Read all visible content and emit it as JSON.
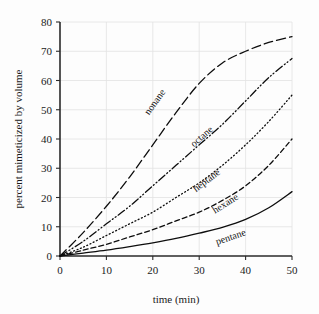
{
  "chart_data": {
    "type": "line",
    "title": "",
    "xlabel": "time (min)",
    "ylabel": "percent mimeticized by volume",
    "xlim": [
      0,
      50
    ],
    "ylim": [
      0,
      80
    ],
    "xticks": [
      0,
      10,
      20,
      30,
      40,
      50
    ],
    "yticks": [
      0,
      10,
      20,
      30,
      40,
      50,
      60,
      70,
      80
    ],
    "grid": true,
    "legend_position": "inline-curve-labels",
    "x": [
      0,
      5,
      10,
      15,
      20,
      25,
      30,
      35,
      40,
      45,
      50
    ],
    "series": [
      {
        "name": "nonane",
        "linestyle": "long-dash",
        "color": "#0d0d0d",
        "values": [
          0,
          8,
          17,
          27,
          38,
          49,
          59,
          66,
          70,
          73,
          75
        ],
        "label_x": 21,
        "label_y": 52
      },
      {
        "name": "octane",
        "linestyle": "dash-dot-dot",
        "color": "#0d0d0d",
        "values": [
          0,
          5,
          11,
          17,
          24,
          31,
          38,
          45,
          53,
          61,
          67.5
        ],
        "label_x": 31,
        "label_y": 40
      },
      {
        "name": "heptane",
        "linestyle": "dotted",
        "color": "#0d0d0d",
        "values": [
          0,
          3,
          7,
          11,
          15,
          20,
          25,
          31,
          38,
          46,
          55
        ],
        "label_x": 32,
        "label_y": 25
      },
      {
        "name": "hexane",
        "linestyle": "dashed",
        "color": "#0d0d0d",
        "values": [
          0,
          2,
          4,
          6.5,
          9,
          12,
          15,
          19,
          24,
          31,
          40
        ],
        "label_x": 36,
        "label_y": 17
      },
      {
        "name": "pentane",
        "linestyle": "solid",
        "color": "#0d0d0d",
        "values": [
          0,
          1,
          2,
          3.2,
          4.5,
          6,
          7.8,
          9.8,
          12.5,
          16.5,
          22
        ],
        "label_x": 37,
        "label_y": 5.5
      }
    ]
  },
  "axes": {
    "x_tick_labels": [
      "0",
      "10",
      "20",
      "30",
      "40",
      "50"
    ],
    "y_tick_labels": [
      "0",
      "10",
      "20",
      "30",
      "40",
      "50",
      "60",
      "70",
      "80"
    ],
    "x_axis_title": "time (min)",
    "y_axis_title": "percent mimeticized by volume"
  }
}
